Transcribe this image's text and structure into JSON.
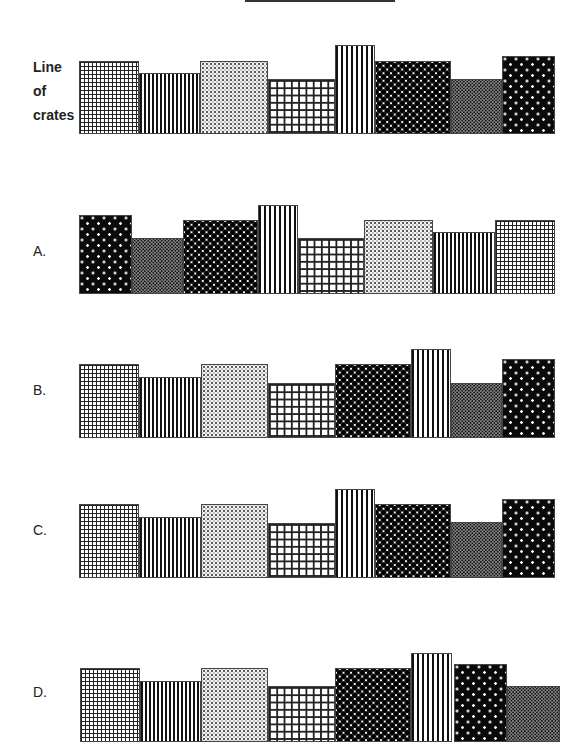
{
  "reference": {
    "label_lines": [
      "Line",
      "of",
      "crates"
    ],
    "crates": [
      {
        "pattern": "grid-fine",
        "left": 79,
        "right": 139,
        "top": 61,
        "bottom": 134
      },
      {
        "pattern": "stripes-fine",
        "left": 139,
        "right": 200,
        "top": 73,
        "bottom": 134
      },
      {
        "pattern": "dots-light",
        "left": 200,
        "right": 268,
        "top": 61,
        "bottom": 134
      },
      {
        "pattern": "grid-coarse",
        "left": 268,
        "right": 335,
        "top": 79,
        "bottom": 134
      },
      {
        "pattern": "stripes-bold",
        "left": 335,
        "right": 375,
        "top": 45,
        "bottom": 134
      },
      {
        "pattern": "diamond",
        "left": 375,
        "right": 451,
        "top": 61,
        "bottom": 134
      },
      {
        "pattern": "checker",
        "left": 451,
        "right": 502,
        "top": 79,
        "bottom": 134
      },
      {
        "pattern": "dark-dots",
        "left": 502,
        "right": 555,
        "top": 56,
        "bottom": 134
      }
    ]
  },
  "options": [
    {
      "label": "A.",
      "label_top": 243,
      "crates": [
        {
          "pattern": "dark-dots",
          "left": 79,
          "right": 132,
          "top": 215,
          "bottom": 294
        },
        {
          "pattern": "checker",
          "left": 132,
          "right": 183,
          "top": 238,
          "bottom": 294
        },
        {
          "pattern": "diamond",
          "left": 183,
          "right": 258,
          "top": 220,
          "bottom": 294
        },
        {
          "pattern": "stripes-bold",
          "left": 258,
          "right": 298,
          "top": 205,
          "bottom": 294
        },
        {
          "pattern": "grid-coarse",
          "left": 298,
          "right": 364,
          "top": 238,
          "bottom": 294
        },
        {
          "pattern": "dots-light",
          "left": 364,
          "right": 433,
          "top": 220,
          "bottom": 294
        },
        {
          "pattern": "stripes-fine",
          "left": 433,
          "right": 495,
          "top": 232,
          "bottom": 294
        },
        {
          "pattern": "grid-fine",
          "left": 495,
          "right": 555,
          "top": 220,
          "bottom": 294
        }
      ]
    },
    {
      "label": "B.",
      "label_top": 382,
      "crates": [
        {
          "pattern": "grid-fine",
          "left": 79,
          "right": 139,
          "top": 364,
          "bottom": 438
        },
        {
          "pattern": "stripes-fine",
          "left": 139,
          "right": 201,
          "top": 377,
          "bottom": 438
        },
        {
          "pattern": "dots-light",
          "left": 201,
          "right": 268,
          "top": 364,
          "bottom": 438
        },
        {
          "pattern": "grid-coarse",
          "left": 268,
          "right": 335,
          "top": 383,
          "bottom": 438
        },
        {
          "pattern": "diamond",
          "left": 335,
          "right": 411,
          "top": 364,
          "bottom": 438
        },
        {
          "pattern": "stripes-bold",
          "left": 411,
          "right": 451,
          "top": 349,
          "bottom": 438
        },
        {
          "pattern": "checker",
          "left": 451,
          "right": 502,
          "top": 383,
          "bottom": 438
        },
        {
          "pattern": "dark-dots",
          "left": 502,
          "right": 555,
          "top": 359,
          "bottom": 438
        }
      ]
    },
    {
      "label": "C.",
      "label_top": 522,
      "crates": [
        {
          "pattern": "grid-fine",
          "left": 79,
          "right": 139,
          "top": 504,
          "bottom": 578
        },
        {
          "pattern": "stripes-fine",
          "left": 139,
          "right": 201,
          "top": 517,
          "bottom": 578
        },
        {
          "pattern": "dots-light",
          "left": 201,
          "right": 268,
          "top": 504,
          "bottom": 578
        },
        {
          "pattern": "grid-coarse",
          "left": 268,
          "right": 335,
          "top": 523,
          "bottom": 578
        },
        {
          "pattern": "stripes-bold",
          "left": 335,
          "right": 375,
          "top": 489,
          "bottom": 578
        },
        {
          "pattern": "diamond",
          "left": 375,
          "right": 451,
          "top": 504,
          "bottom": 578
        },
        {
          "pattern": "checker",
          "left": 451,
          "right": 502,
          "top": 522,
          "bottom": 578
        },
        {
          "pattern": "dark-dots",
          "left": 502,
          "right": 555,
          "top": 499,
          "bottom": 578
        }
      ]
    },
    {
      "label": "D.",
      "label_top": 684,
      "crates": [
        {
          "pattern": "grid-fine",
          "left": 80,
          "right": 140,
          "top": 668,
          "bottom": 742
        },
        {
          "pattern": "stripes-fine",
          "left": 140,
          "right": 201,
          "top": 681,
          "bottom": 742
        },
        {
          "pattern": "dots-light",
          "left": 201,
          "right": 268,
          "top": 668,
          "bottom": 742
        },
        {
          "pattern": "grid-coarse",
          "left": 268,
          "right": 335,
          "top": 686,
          "bottom": 742
        },
        {
          "pattern": "diamond",
          "left": 335,
          "right": 411,
          "top": 668,
          "bottom": 742
        },
        {
          "pattern": "stripes-bold",
          "left": 411,
          "right": 452,
          "top": 653,
          "bottom": 742
        },
        {
          "pattern": "dark-dots",
          "left": 454,
          "right": 507,
          "top": 664,
          "bottom": 742
        },
        {
          "pattern": "checker",
          "left": 507,
          "right": 560,
          "top": 686,
          "bottom": 742
        }
      ]
    }
  ]
}
